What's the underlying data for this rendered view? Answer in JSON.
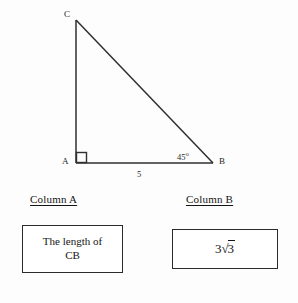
{
  "figure": {
    "type": "right-triangle-diagram",
    "vertices": {
      "C": {
        "label": "C",
        "x": 76,
        "y": 20
      },
      "A": {
        "label": "A",
        "x": 76,
        "y": 163
      },
      "B": {
        "label": "B",
        "x": 213,
        "y": 163
      }
    },
    "right_angle_marker": {
      "at": "A"
    },
    "angle_label": {
      "value": "45",
      "degree_symbol": "o",
      "at": "B"
    },
    "side_label": {
      "value": "5",
      "side": "AB"
    },
    "stroke_color": "#2f2f2f"
  },
  "columns": {
    "column_a": {
      "header": "Column A",
      "value_line1": "The length of",
      "value_line2": "CB"
    },
    "column_b": {
      "header": "Column B",
      "coefficient": "3",
      "radical_symbol": "√",
      "radicand": "3"
    }
  }
}
